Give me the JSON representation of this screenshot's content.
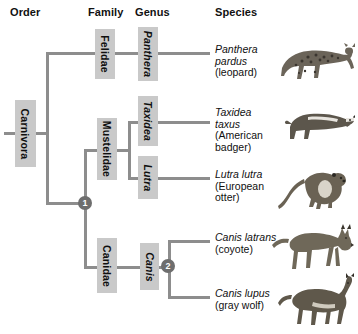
{
  "headers": {
    "order": "Order",
    "family": "Family",
    "genus": "Genus",
    "species": "Species"
  },
  "order_taxa": [
    {
      "name": "Carnivora"
    }
  ],
  "family_taxa": [
    {
      "name": "Felidae"
    },
    {
      "name": "Mustelidae"
    },
    {
      "name": "Canidae"
    }
  ],
  "genus_taxa": [
    {
      "name": "Panthera"
    },
    {
      "name": "Taxidea"
    },
    {
      "name": "Lutra"
    },
    {
      "name": "Canis"
    }
  ],
  "nodes": [
    {
      "label": "1"
    },
    {
      "label": "2"
    }
  ],
  "species": [
    {
      "scientific": "Panthera pardus",
      "common": "(leopard)",
      "art": "leopard"
    },
    {
      "scientific": "Taxidea taxus",
      "common": "(American badger)",
      "art": "badger"
    },
    {
      "scientific": "Lutra lutra",
      "common": "(European otter)",
      "art": "otter"
    },
    {
      "scientific": "Canis latrans",
      "common": "(coyote)",
      "art": "coyote"
    },
    {
      "scientific": "Canis lupus",
      "common": "(gray wolf)",
      "art": "gray-wolf"
    }
  ],
  "colors": {
    "line": "#8d8d8d",
    "rank_box": "#c9c9c9",
    "node": "#6e6e6e",
    "text": "#101010"
  }
}
